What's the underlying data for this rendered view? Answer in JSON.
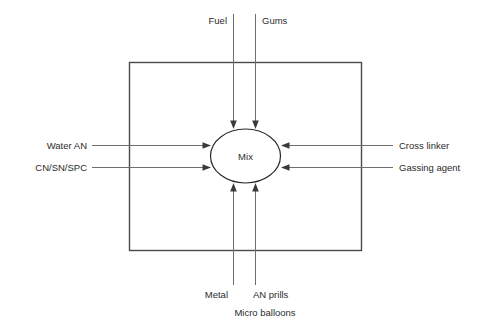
{
  "diagram": {
    "center_node": {
      "label": "Mix",
      "shape": "ellipse"
    },
    "boundary": {
      "shape": "rectangle",
      "label": ""
    },
    "inputs_top": [
      {
        "label": "Fuel"
      },
      {
        "label": "Gums"
      }
    ],
    "inputs_left": [
      {
        "label": "Water AN"
      },
      {
        "label": "CN/SN/SPC"
      }
    ],
    "inputs_right": [
      {
        "label": "Cross linker"
      },
      {
        "label": "Gassing agent"
      }
    ],
    "inputs_bottom": [
      {
        "label": "Metal"
      },
      {
        "label": "AN prills"
      },
      {
        "label": "Micro balloons"
      }
    ],
    "colors": {
      "background": "#ffffff",
      "text": "#2b2b2b",
      "arrow_line": "#6e6e6e",
      "arrow_head": "#3a3a3a",
      "boundary_stroke": "#4a4a4a",
      "ellipse_stroke": "#2b2b2b"
    }
  }
}
